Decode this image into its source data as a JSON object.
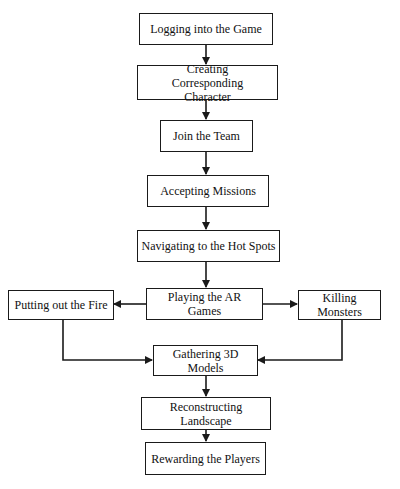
{
  "diagram": {
    "type": "flowchart",
    "nodes": [
      {
        "id": "login",
        "label": "Logging into the Game"
      },
      {
        "id": "create",
        "label": "Creating Corresponding Character"
      },
      {
        "id": "join",
        "label": "Join the Team"
      },
      {
        "id": "accept",
        "label": "Accepting Missions"
      },
      {
        "id": "navigate",
        "label": "Navigating to the Hot Spots"
      },
      {
        "id": "play",
        "label": "Playing the AR Games"
      },
      {
        "id": "fire",
        "label": "Putting out the Fire"
      },
      {
        "id": "monsters",
        "label": "Killing Monsters"
      },
      {
        "id": "gather",
        "label": "Gathering 3D Models"
      },
      {
        "id": "reconstruct",
        "label": "Reconstructing Landscape"
      },
      {
        "id": "reward",
        "label": "Rewarding the Players"
      }
    ],
    "edges": [
      {
        "from": "login",
        "to": "create"
      },
      {
        "from": "create",
        "to": "join"
      },
      {
        "from": "join",
        "to": "accept"
      },
      {
        "from": "accept",
        "to": "navigate"
      },
      {
        "from": "navigate",
        "to": "play"
      },
      {
        "from": "play",
        "to": "fire"
      },
      {
        "from": "play",
        "to": "monsters"
      },
      {
        "from": "fire",
        "to": "gather"
      },
      {
        "from": "monsters",
        "to": "gather"
      },
      {
        "from": "gather",
        "to": "reconstruct"
      },
      {
        "from": "reconstruct",
        "to": "reward"
      }
    ],
    "colors": {
      "stroke": "#1a1a1a",
      "background": "#ffffff"
    }
  }
}
